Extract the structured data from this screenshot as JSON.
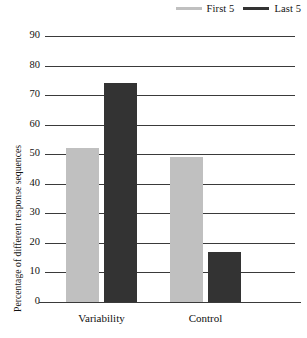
{
  "chart_data": {
    "type": "bar",
    "title": "",
    "xlabel": "",
    "ylabel": "Percentage of different response sequences",
    "categories": [
      "Variability",
      "Control"
    ],
    "series": [
      {
        "name": "First 5",
        "color": "#c0c0c0",
        "values": [
          52,
          49
        ]
      },
      {
        "name": "Last 5",
        "color": "#333333",
        "values": [
          74,
          17
        ]
      }
    ],
    "ylim": [
      0,
      90
    ],
    "yticks": [
      0,
      10,
      20,
      30,
      40,
      50,
      60,
      70,
      80,
      90
    ],
    "ytick_labels": [
      "0",
      "10",
      "20",
      "30",
      "40",
      "50",
      "60",
      "70",
      "80",
      "90"
    ],
    "grid": "horizontal",
    "legend_position": "top-right"
  },
  "legend": {
    "entries": [
      {
        "label": "First 5",
        "color": "#c0c0c0"
      },
      {
        "label": "Last 5",
        "color": "#333333"
      }
    ]
  },
  "axes": {
    "y_title": "Percentage of different response sequences"
  }
}
